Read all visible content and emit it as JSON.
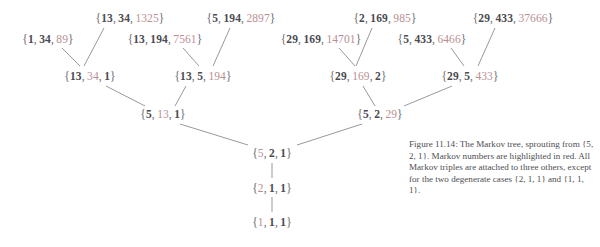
{
  "figure": {
    "type": "tree-diagram",
    "title_text": "Markov tree",
    "markov_highlight_color": "#b98f94",
    "plain_color": "#4b4b50",
    "background": "#ffffff"
  },
  "caption": {
    "text": "Figure 11.14: The Markov tree, sprouting from {5, 2, 1}. Markov numbers are highlighted in red. All Markov triples are attached to three others, except for the two degenerate cases {2, 1, 1} and {1, 1, 1}."
  },
  "nodes": [
    {
      "id": "n_1_34_89",
      "label": "{1, 34, 89}",
      "parts": [
        "1",
        "34",
        "89"
      ],
      "markov_index": 2,
      "x": 48,
      "y": 39
    },
    {
      "id": "n_13_34_1325",
      "label": "{13, 34, 1325}",
      "parts": [
        "13",
        "34",
        "1325"
      ],
      "markov_index": 2,
      "x": 130,
      "y": 18
    },
    {
      "id": "n_13_194_7561",
      "label": "{13, 194, 7561}",
      "parts": [
        "13",
        "194",
        "7561"
      ],
      "markov_index": 2,
      "x": 165,
      "y": 39
    },
    {
      "id": "n_5_194_2897",
      "label": "{5, 194, 2897}",
      "parts": [
        "5",
        "194",
        "2897"
      ],
      "markov_index": 2,
      "x": 241,
      "y": 18
    },
    {
      "id": "n_29_169_14701",
      "label": "{29, 169, 14701}",
      "parts": [
        "29",
        "169",
        "14701"
      ],
      "markov_index": 2,
      "x": 321,
      "y": 39
    },
    {
      "id": "n_2_169_985",
      "label": "{2, 169, 985}",
      "parts": [
        "2",
        "169",
        "985"
      ],
      "markov_index": 2,
      "x": 385,
      "y": 18
    },
    {
      "id": "n_5_433_6466",
      "label": "{5, 433, 6466}",
      "parts": [
        "5",
        "433",
        "6466"
      ],
      "markov_index": 2,
      "x": 432,
      "y": 39
    },
    {
      "id": "n_29_433_37666",
      "label": "{29, 433, 37666}",
      "parts": [
        "29",
        "433",
        "37666"
      ],
      "markov_index": 2,
      "x": 513,
      "y": 18
    },
    {
      "id": "n_13_34_1",
      "label": "{13, 34, 1}",
      "parts": [
        "13",
        "34",
        "1"
      ],
      "markov_index": 1,
      "x": 90,
      "y": 76
    },
    {
      "id": "n_13_5_194",
      "label": "{13, 5, 194}",
      "parts": [
        "13",
        "5",
        "194"
      ],
      "markov_index": 2,
      "x": 203,
      "y": 76
    },
    {
      "id": "n_29_169_2",
      "label": "{29, 169, 2}",
      "parts": [
        "29",
        "169",
        "2"
      ],
      "markov_index": 1,
      "x": 358,
      "y": 76
    },
    {
      "id": "n_29_5_433",
      "label": "{29, 5, 433}",
      "parts": [
        "29",
        "5",
        "433"
      ],
      "markov_index": 2,
      "x": 470,
      "y": 76
    },
    {
      "id": "n_5_13_1",
      "label": "{5, 13, 1}",
      "parts": [
        "5",
        "13",
        "1"
      ],
      "markov_index": 1,
      "x": 163,
      "y": 114
    },
    {
      "id": "n_5_2_29",
      "label": "{5, 2, 29}",
      "parts": [
        "5",
        "2",
        "29"
      ],
      "markov_index": 2,
      "x": 380,
      "y": 114
    },
    {
      "id": "n_5_2_1",
      "label": "{5, 2, 1}",
      "parts": [
        "5",
        "2",
        "1"
      ],
      "markov_index": 0,
      "x": 272,
      "y": 153
    },
    {
      "id": "n_2_1_1",
      "label": "{2, 1, 1}",
      "parts": [
        "2",
        "1",
        "1"
      ],
      "markov_index": 0,
      "x": 272,
      "y": 188
    },
    {
      "id": "n_1_1_1",
      "label": "{1, 1, 1}",
      "parts": [
        "1",
        "1",
        "1"
      ],
      "markov_index": 0,
      "x": 272,
      "y": 222
    }
  ],
  "edges": [
    {
      "from": "n_1_34_89",
      "to": "n_13_34_1",
      "x1": 62,
      "y1": 48,
      "x2": 80,
      "y2": 66
    },
    {
      "from": "n_13_34_1325",
      "to": "n_13_34_1",
      "x1": 104,
      "y1": 28,
      "x2": 84,
      "y2": 66
    },
    {
      "from": "n_13_194_7561",
      "to": "n_13_5_194",
      "x1": 183,
      "y1": 48,
      "x2": 199,
      "y2": 66
    },
    {
      "from": "n_5_194_2897",
      "to": "n_13_5_194",
      "x1": 230,
      "y1": 28,
      "x2": 213,
      "y2": 66
    },
    {
      "from": "n_29_169_14701",
      "to": "n_29_169_2",
      "x1": 339,
      "y1": 48,
      "x2": 355,
      "y2": 66
    },
    {
      "from": "n_2_169_985",
      "to": "n_29_169_2",
      "x1": 372,
      "y1": 28,
      "x2": 356,
      "y2": 66
    },
    {
      "from": "n_5_433_6466",
      "to": "n_29_5_433",
      "x1": 451,
      "y1": 48,
      "x2": 464,
      "y2": 66
    },
    {
      "from": "n_29_433_37666",
      "to": "n_29_5_433",
      "x1": 495,
      "y1": 28,
      "x2": 478,
      "y2": 66
    },
    {
      "from": "n_13_34_1",
      "to": "n_5_13_1",
      "x1": 106,
      "y1": 86,
      "x2": 145,
      "y2": 106
    },
    {
      "from": "n_13_5_194",
      "to": "n_5_13_1",
      "x1": 186,
      "y1": 86,
      "x2": 175,
      "y2": 106
    },
    {
      "from": "n_29_169_2",
      "to": "n_5_2_29",
      "x1": 363,
      "y1": 86,
      "x2": 375,
      "y2": 106
    },
    {
      "from": "n_29_5_433",
      "to": "n_5_2_29",
      "x1": 452,
      "y1": 86,
      "x2": 404,
      "y2": 106
    },
    {
      "from": "n_5_13_1",
      "to": "n_5_2_1",
      "x1": 180,
      "y1": 124,
      "x2": 248,
      "y2": 145
    },
    {
      "from": "n_5_2_29",
      "to": "n_5_2_1",
      "x1": 362,
      "y1": 124,
      "x2": 297,
      "y2": 145
    },
    {
      "from": "n_5_2_1",
      "to": "n_2_1_1",
      "x1": 272,
      "y1": 163,
      "x2": 272,
      "y2": 178
    },
    {
      "from": "n_2_1_1",
      "to": "n_1_1_1",
      "x1": 272,
      "y1": 197,
      "x2": 272,
      "y2": 212
    }
  ],
  "line_color": "#8d8d93"
}
